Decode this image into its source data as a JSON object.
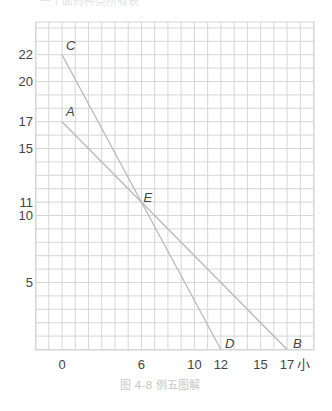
{
  "header": {
    "cut_text": "一个面的种类所有表"
  },
  "chart_data": {
    "type": "line",
    "title": "",
    "xlabel": "小",
    "ylabel": "",
    "caption": "图 4-8   例五图解",
    "x_ticks": [
      0,
      6,
      10,
      12,
      15,
      17
    ],
    "x_tick_labels": [
      "0",
      "6",
      "10",
      "12",
      "15",
      "17"
    ],
    "y_ticks": [
      5,
      10,
      11,
      15,
      17,
      20,
      22
    ],
    "y_tick_labels": [
      "5",
      "10",
      "11",
      "15",
      "17",
      "20",
      "22"
    ],
    "xlim": [
      -2,
      19
    ],
    "ylim": [
      0,
      24.5
    ],
    "grid": true,
    "series": [
      {
        "name": "AB",
        "points": [
          [
            0,
            17
          ],
          [
            17,
            0
          ]
        ]
      },
      {
        "name": "CD",
        "points": [
          [
            0,
            22
          ],
          [
            12,
            0
          ]
        ]
      }
    ],
    "points": [
      {
        "label": "A",
        "x": 0,
        "y": 17
      },
      {
        "label": "B",
        "x": 17,
        "y": 0
      },
      {
        "label": "C",
        "x": 0,
        "y": 22
      },
      {
        "label": "D",
        "x": 12,
        "y": 0
      },
      {
        "label": "E",
        "x": 6,
        "y": 11
      }
    ],
    "colors": {
      "grid": "#d6d6d6",
      "line": "#b9b9b9",
      "text": "#444444",
      "caption": "#c8c8c8"
    }
  }
}
